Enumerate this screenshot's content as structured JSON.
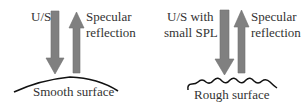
{
  "colors": {
    "arrow_fill": "#808080",
    "arrow_stroke": "#6e6e6e",
    "surface": "#111111",
    "text": "#333333",
    "background": "#ffffff"
  },
  "panels": [
    {
      "id": "smooth",
      "incident_label": [
        "U/S"
      ],
      "reflection_label": [
        "Specular",
        "reflection"
      ],
      "surface_label": "Smooth surface",
      "surface_type": "smooth-arc"
    },
    {
      "id": "rough",
      "incident_label": [
        "U/S with",
        "small SPL"
      ],
      "reflection_label": [
        "Specular",
        "reflection"
      ],
      "surface_label": "Rough surface",
      "surface_type": "wavy"
    }
  ]
}
